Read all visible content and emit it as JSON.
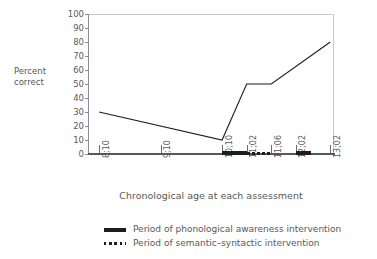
{
  "chart_data": {
    "type": "line",
    "title": "",
    "xlabel": "Chronological age at each assessment",
    "ylabel_lines": [
      "Percent",
      "correct"
    ],
    "ylabel": "Percent correct",
    "categories": [
      "8;10",
      "9;10",
      "10;10",
      "11;02",
      "11;06",
      "12;02",
      "13;02"
    ],
    "values": [
      30,
      null,
      10,
      50,
      50,
      null,
      80
    ],
    "series": [
      {
        "name": "Percent correct",
        "points": [
          {
            "x": "8;10",
            "y": 30
          },
          {
            "x": "10;10",
            "y": 10
          },
          {
            "x": "11;02",
            "y": 50
          },
          {
            "x": "11;06",
            "y": 50
          },
          {
            "x": "13;02",
            "y": 80
          }
        ]
      }
    ],
    "ylim": [
      0,
      100
    ],
    "yticks": [
      0,
      10,
      20,
      30,
      40,
      50,
      60,
      70,
      80,
      90,
      100
    ],
    "xticks": [
      "8;10",
      "9;10",
      "10;10",
      "11;02",
      "11;06",
      "12;02",
      "13;02"
    ],
    "grid": false,
    "legend_position": "bottom",
    "line_color": "#1d1d1f",
    "axis_color": "#58585a",
    "annotations": [
      {
        "name": "phonological-bar-1",
        "style": "solid",
        "from": "10;10",
        "to": "11;02"
      },
      {
        "name": "semantic-syntactic-bar",
        "style": "dotted",
        "from": "11;02",
        "to": "11;06"
      },
      {
        "name": "phonological-bar-2",
        "style": "solid",
        "from": "12;02",
        "to": "12;07"
      }
    ]
  },
  "axes": {
    "y_title_line1": "Percent",
    "y_title_line2": "correct",
    "x_title": "Chronological age at each assessment",
    "y_ticks": [
      "100",
      "90",
      "80",
      "70",
      "60",
      "50",
      "40",
      "30",
      "20",
      "10",
      "0"
    ],
    "x_ticks": [
      "8;10",
      "9;10",
      "10;10",
      "11;02",
      "11;06",
      "12;02",
      "13;02"
    ]
  },
  "legend": {
    "items": [
      {
        "marker": "solid-line-swatch",
        "label": "Period of phonological awareness intervention"
      },
      {
        "marker": "dotted-line-swatch",
        "label": "Period of semantic–syntactic intervention"
      }
    ]
  },
  "colors": {
    "line": "#1d1d1f",
    "text": "#58585a",
    "frame": "#c9c9cb",
    "axis": "#58585a"
  }
}
